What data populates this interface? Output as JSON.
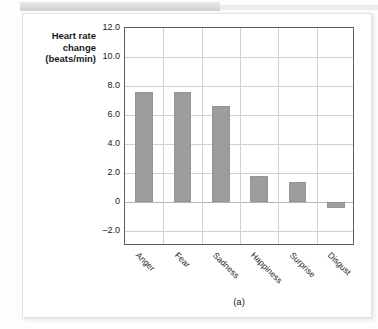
{
  "figure": {
    "caption": "(a)"
  },
  "chart_data": {
    "type": "bar",
    "title": "",
    "xlabel": "",
    "ylabel": "Heart rate change (beats/min)",
    "ylabel_lines": [
      "Heart rate",
      "change",
      "(beats/min)"
    ],
    "categories": [
      "Anger",
      "Fear",
      "Sadness",
      "Happiness",
      "Surprise",
      "Disgust"
    ],
    "values": [
      7.6,
      7.6,
      6.6,
      1.8,
      1.4,
      -0.4
    ],
    "ylim": [
      -3.0,
      12.0
    ],
    "yticks": [
      12.0,
      10.0,
      8.0,
      6.0,
      4.0,
      2.0,
      0,
      -2.0
    ],
    "ytick_labels": [
      "12.0",
      "10.0",
      "8.0",
      "6.0",
      "4.0",
      "2.0",
      "0",
      "–2.0"
    ],
    "grid": true,
    "legend": "none",
    "bar_color": "#9d9d9d",
    "axis_color": "#5e5e5e",
    "grid_color": "#d0d0d0"
  }
}
